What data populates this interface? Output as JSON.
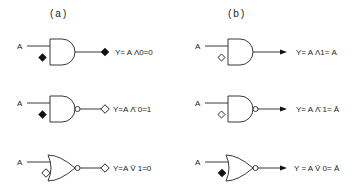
{
  "columns": [
    {
      "header": "(a)",
      "rows": [
        {
          "gate": "AND",
          "input": "A",
          "control": "filled-diamond",
          "output_marker": "filled-diamond",
          "equation": "Y= A Λ0=0"
        },
        {
          "gate": "NAND",
          "input": "A",
          "control": "filled-diamond",
          "output_marker": "open-diamond",
          "equation": "Y=A Λ̄ 0=1"
        },
        {
          "gate": "NOR",
          "input": "A",
          "control": "open-diamond",
          "output_marker": "open-diamond",
          "equation": "Y=A V̄ 1=0"
        }
      ]
    },
    {
      "header": "(b)",
      "rows": [
        {
          "gate": "AND",
          "input": "A",
          "control": "open-diamond",
          "output_marker": "arrow",
          "equation": "Y= A Λ1= A"
        },
        {
          "gate": "NAND",
          "input": "A",
          "control": "open-diamond",
          "output_marker": "arrow",
          "equation": "Y= A Λ̄ 1= Ā"
        },
        {
          "gate": "NOR",
          "input": "A",
          "control": "filled-diamond",
          "output_marker": "arrow",
          "equation": "Y = A V̄ 0= Ā"
        }
      ]
    }
  ]
}
